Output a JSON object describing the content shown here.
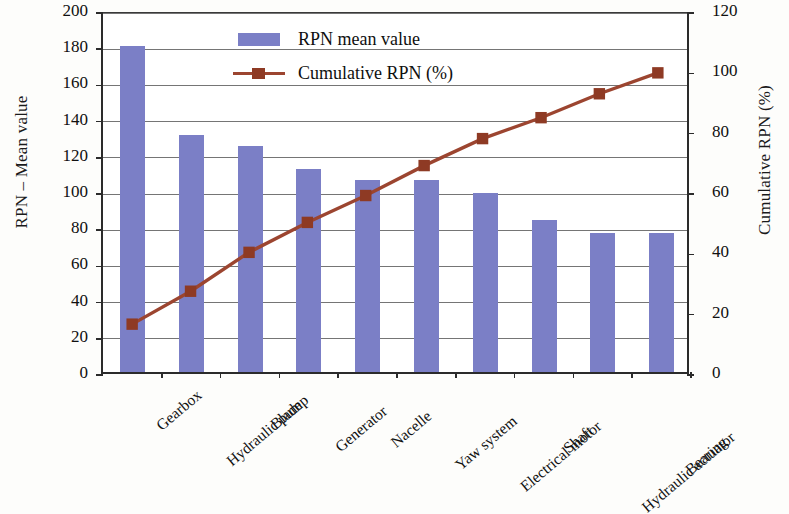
{
  "chart_data": {
    "type": "bar",
    "title": "",
    "subtitle": "",
    "categories": [
      "Gearbox",
      "Hydraulic pump",
      "Blade",
      "Generator",
      "Nacelle",
      "Yaw system",
      "Electrical motor",
      "Shaft",
      "Hydraulic actuator",
      "Bearing"
    ],
    "series": [
      {
        "name": "RPN mean value",
        "type": "bar",
        "axis": "left",
        "color": "#7b7fc6",
        "values": [
          180,
          131,
          125,
          112,
          106,
          106,
          99,
          84,
          77,
          77
        ]
      },
      {
        "name": "Cumulative RPN (%)",
        "type": "line",
        "axis": "right",
        "color": "#9c4530",
        "marker": "square",
        "values": [
          16,
          27,
          40,
          50,
          59,
          69,
          78,
          85,
          93,
          100
        ]
      }
    ],
    "xlabel": "",
    "ylabel": "RPN – Mean value",
    "y2label": "Cumulative RPN (%)",
    "ylim": [
      0,
      200
    ],
    "y2lim": [
      0,
      120
    ],
    "yticks": [
      0,
      20,
      40,
      60,
      80,
      100,
      120,
      140,
      160,
      180,
      200
    ],
    "y2ticks": [
      0,
      20,
      40,
      60,
      80,
      100,
      120
    ],
    "ytick_labels": [
      "0",
      "20",
      "40",
      "60",
      "80",
      "100",
      "120",
      "140",
      "160",
      "180",
      "200"
    ],
    "y2tick_labels": [
      "0",
      "20",
      "40",
      "60",
      "80",
      "100",
      "120"
    ],
    "grid": true,
    "grid_axis": "y",
    "legend": [
      {
        "label": "RPN mean value",
        "key": "bar-swatch",
        "color": "#7b7fc6"
      },
      {
        "label": "Cumulative RPN (%)",
        "key": "line-swatch",
        "color": "#9c4530"
      }
    ],
    "legend_position": "top-center",
    "xlabel_rotation": -40,
    "background": "#ffffff",
    "axis_color": "#2b2b2b",
    "gridline_color": "#5d5d5d"
  }
}
